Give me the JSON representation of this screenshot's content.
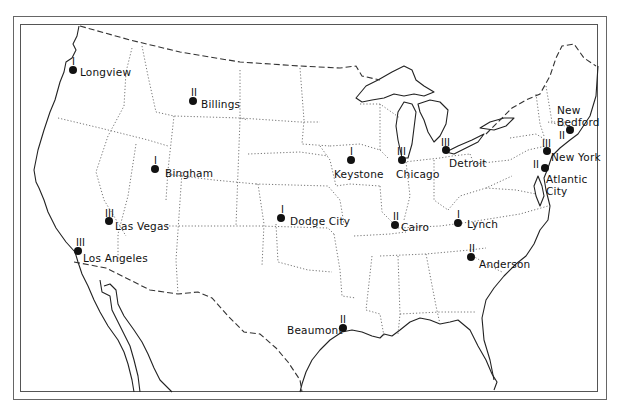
{
  "map": {
    "region": "Continental United States",
    "style": "black-and-white outline map with dashed national borders and dotted state borders",
    "colors": {
      "background": "#ffffff",
      "ink": "#111111",
      "frame": "#555555"
    }
  },
  "cities": [
    {
      "name": "Longview",
      "rank": "I",
      "dot": [
        73,
        70
      ],
      "rank_pos": [
        72,
        57
      ],
      "label_pos": [
        80,
        66
      ]
    },
    {
      "name": "Billings",
      "rank": "II",
      "dot": [
        193,
        101
      ],
      "rank_pos": [
        191,
        88
      ],
      "label_pos": [
        201,
        98
      ]
    },
    {
      "name": "Bingham",
      "rank": "I",
      "dot": [
        155,
        169
      ],
      "rank_pos": [
        154,
        156
      ],
      "label_pos": [
        165,
        167
      ]
    },
    {
      "name": "Las Vegas",
      "rank": "III",
      "dot": [
        109,
        221
      ],
      "rank_pos": [
        105,
        209
      ],
      "label_pos": [
        115,
        220
      ]
    },
    {
      "name": "Los Angeles",
      "rank": "III",
      "dot": [
        78,
        251
      ],
      "rank_pos": [
        76,
        238
      ],
      "label_pos": [
        83,
        252
      ]
    },
    {
      "name": "Dodge City",
      "rank": "I",
      "dot": [
        281,
        218
      ],
      "rank_pos": [
        281,
        205
      ],
      "label_pos": [
        290,
        215
      ]
    },
    {
      "name": "Keystone",
      "rank": "I",
      "dot": [
        351,
        160
      ],
      "rank_pos": [
        350,
        147
      ],
      "label_pos": [
        334,
        168
      ]
    },
    {
      "name": "Chicago",
      "rank": "III",
      "dot": [
        402,
        160
      ],
      "rank_pos": [
        397,
        147
      ],
      "label_pos": [
        396,
        168
      ]
    },
    {
      "name": "Detroit",
      "rank": "III",
      "dot": [
        446,
        150
      ],
      "rank_pos": [
        441,
        138
      ],
      "label_pos": [
        449,
        157
      ]
    },
    {
      "name": "Cairo",
      "rank": "II",
      "dot": [
        395,
        225
      ],
      "rank_pos": [
        393,
        212
      ],
      "label_pos": [
        401,
        221
      ]
    },
    {
      "name": "Lynch",
      "rank": "I",
      "dot": [
        458,
        223
      ],
      "rank_pos": [
        457,
        210
      ],
      "label_pos": [
        467,
        218
      ]
    },
    {
      "name": "Anderson",
      "rank": "II",
      "dot": [
        471,
        257
      ],
      "rank_pos": [
        469,
        244
      ],
      "label_pos": [
        479,
        258
      ]
    },
    {
      "name": "Beaumont",
      "rank": "II",
      "dot": [
        343,
        328
      ],
      "rank_pos": [
        340,
        315
      ],
      "label_pos": [
        287,
        324
      ]
    },
    {
      "name": "New Bedford",
      "rank": "II",
      "dot": [
        570,
        130
      ],
      "rank_pos": [
        559,
        131
      ],
      "label_pos": [
        557,
        104
      ]
    },
    {
      "name": "New York",
      "rank": "III",
      "dot": [
        547,
        151
      ],
      "rank_pos": [
        542,
        139
      ],
      "label_pos": [
        551,
        151
      ]
    },
    {
      "name": "Atlantic City",
      "rank": "II",
      "dot": [
        545,
        168
      ],
      "rank_pos": [
        533,
        160
      ],
      "label_pos": [
        546,
        173
      ]
    }
  ]
}
